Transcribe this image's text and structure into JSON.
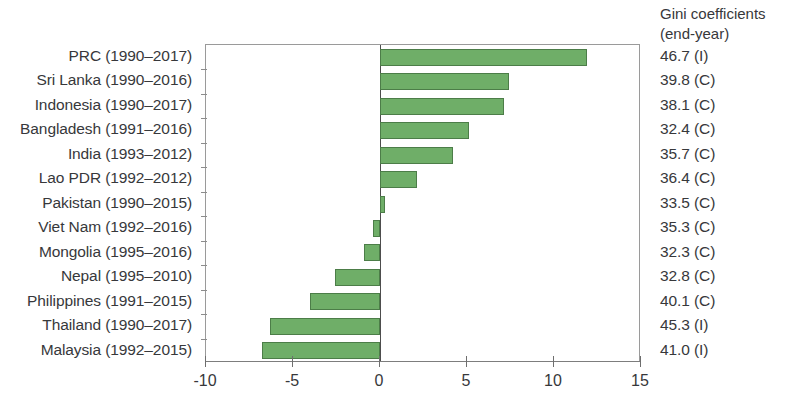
{
  "chart_data": {
    "type": "bar",
    "orientation": "horizontal",
    "title": "",
    "subtitle": "",
    "xlabel": "",
    "ylabel": "",
    "xlim": [
      -10,
      15
    ],
    "xticks": [
      -10,
      -5,
      0,
      5,
      10,
      15
    ],
    "xtick_labels": [
      "-10",
      "-5",
      "0",
      "5",
      "10",
      "15"
    ],
    "grid": false,
    "legend": null,
    "bar_color": "#6fae68",
    "bar_edge_color": "#4c7d48",
    "zero_line_color": "#4d4d4d",
    "categories": [
      "PRC  (1990–2017)",
      "Sri Lanka  (1990–2016)",
      "Indonesia  (1990–2017)",
      "Bangladesh  (1991–2016)",
      "India  (1993–2012)",
      "Lao PDR  (1992–2012)",
      "Pakistan  (1990–2015)",
      "Viet Nam  (1992–2016)",
      "Mongolia  (1995–2016)",
      "Nepal  (1995–2010)",
      "Philippines  (1991–2015)",
      "Thailand  (1990–2017)",
      "Malaysia  (1992–2015)"
    ],
    "values": [
      11.9,
      7.4,
      7.1,
      5.1,
      4.2,
      2.1,
      0.3,
      -0.4,
      -0.9,
      -2.6,
      -4.0,
      -6.3,
      -6.8
    ],
    "annotation_column": {
      "header_line1": "Gini coefficients",
      "header_line2": "(end-year)",
      "values": [
        "46.7 (I)",
        "39.8 (C)",
        "38.1 (C)",
        "32.4 (C)",
        "35.7 (C)",
        "36.4 (C)",
        "33.5 (C)",
        "35.3 (C)",
        "32.3 (C)",
        "32.8 (C)",
        "40.1 (C)",
        "45.3 (I)",
        "41.0 (I)"
      ]
    }
  }
}
